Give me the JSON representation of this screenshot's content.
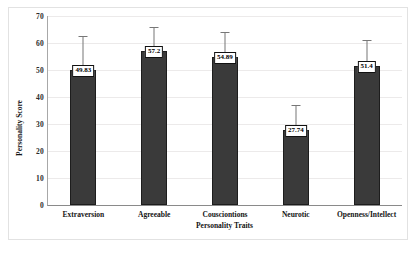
{
  "chart_data": {
    "type": "bar",
    "title": "",
    "xlabel": "Personality Traits",
    "ylabel": "Personality Score",
    "categories": [
      "Extraversion",
      "Agreeable",
      "Cousciontions",
      "Neurotic",
      "Openness/Intellect"
    ],
    "values": [
      49.83,
      57.2,
      54.89,
      27.74,
      51.4
    ],
    "value_labels": [
      "49.83",
      "57.2",
      "54.89",
      "27.74",
      "51.4"
    ],
    "error_upper": [
      62.5,
      66.0,
      64.0,
      37.0,
      61.0
    ],
    "ylim": [
      0,
      70
    ],
    "yticks": [
      0,
      10,
      20,
      30,
      40,
      50,
      60,
      70
    ],
    "ytick_labels": [
      "0",
      "10",
      "20",
      "30",
      "40",
      "50",
      "60",
      "70"
    ],
    "grid": true,
    "legend": false,
    "bar_color": "#3a3a3a",
    "bar_edge_color": "#1d1d1d",
    "error_bar_color": "#777777",
    "gridline_color": "#eceaea",
    "label_box_background": "#ffffff",
    "label_box_border": "#111111"
  }
}
